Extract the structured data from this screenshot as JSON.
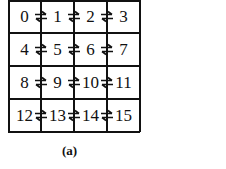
{
  "diagram": {
    "rows": 4,
    "cols": 4,
    "nodes": [
      "0",
      "1",
      "2",
      "3",
      "4",
      "5",
      "6",
      "7",
      "8",
      "9",
      "10",
      "11",
      "12",
      "13",
      "14",
      "15"
    ],
    "edges": [
      {
        "from": "0",
        "to": "1",
        "type": "bidirectional"
      },
      {
        "from": "1",
        "to": "2",
        "type": "bidirectional"
      },
      {
        "from": "2",
        "to": "3",
        "type": "bidirectional"
      },
      {
        "from": "4",
        "to": "5",
        "type": "bidirectional"
      },
      {
        "from": "5",
        "to": "6",
        "type": "bidirectional"
      },
      {
        "from": "6",
        "to": "7",
        "type": "bidirectional"
      },
      {
        "from": "8",
        "to": "9",
        "type": "bidirectional"
      },
      {
        "from": "9",
        "to": "10",
        "type": "bidirectional"
      },
      {
        "from": "10",
        "to": "11",
        "type": "bidirectional"
      },
      {
        "from": "12",
        "to": "13",
        "type": "bidirectional"
      },
      {
        "from": "13",
        "to": "14",
        "type": "bidirectional"
      },
      {
        "from": "14",
        "to": "15",
        "type": "bidirectional"
      }
    ],
    "caption": "(a)",
    "line_color": "#111111"
  }
}
